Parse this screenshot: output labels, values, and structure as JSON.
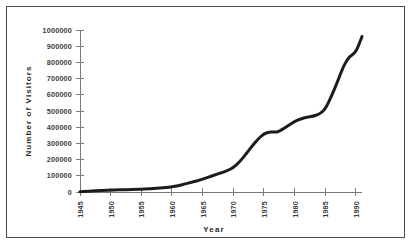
{
  "chart_data": {
    "type": "line",
    "title": "",
    "xlabel": "Year",
    "ylabel": "Number of Visitors",
    "xlim": [
      1945,
      1991
    ],
    "ylim": [
      0,
      1000000
    ],
    "grid": false,
    "legend": false,
    "legend_position": "none",
    "line_color": "#1c1c1c",
    "axis_color": "#7a7a7a",
    "background_color": "#ffffff",
    "border_color": "#4a4a4a",
    "x_tick_labels": [
      "1945",
      "1950",
      "1955",
      "1960",
      "1965",
      "1970",
      "1975",
      "1980",
      "1985",
      "1990"
    ],
    "x_tick_values": [
      1945,
      1950,
      1955,
      1960,
      1965,
      1970,
      1975,
      1980,
      1985,
      1990
    ],
    "x_tick_rotation": 90,
    "y_tick_labels": [
      "0",
      "100000",
      "200000",
      "300000",
      "400000",
      "500000",
      "600000",
      "700000",
      "800000",
      "900000",
      "1000000"
    ],
    "y_tick_values": [
      0,
      100000,
      200000,
      300000,
      400000,
      500000,
      600000,
      700000,
      800000,
      900000,
      1000000
    ],
    "series": [
      {
        "name": "Number of Visitors",
        "x": [
          1945,
          1946,
          1947,
          1948,
          1949,
          1950,
          1951,
          1952,
          1953,
          1954,
          1955,
          1956,
          1957,
          1958,
          1959,
          1960,
          1961,
          1962,
          1963,
          1964,
          1965,
          1966,
          1967,
          1968,
          1969,
          1970,
          1971,
          1972,
          1973,
          1974,
          1975,
          1976,
          1977,
          1978,
          1979,
          1980,
          1981,
          1982,
          1983,
          1984,
          1985,
          1986,
          1987,
          1988,
          1989,
          1990,
          1991
        ],
        "values": [
          2000,
          4000,
          6000,
          8000,
          10000,
          12000,
          13000,
          14000,
          15000,
          16000,
          17000,
          19000,
          21000,
          24000,
          27000,
          31000,
          39000,
          48000,
          58000,
          68000,
          79000,
          92000,
          105000,
          118000,
          131000,
          150000,
          185000,
          230000,
          280000,
          325000,
          360000,
          372000,
          368000,
          385000,
          410000,
          435000,
          452000,
          462000,
          468000,
          480000,
          510000,
          590000,
          680000,
          780000,
          840000,
          860000,
          960000
        ]
      }
    ]
  },
  "axis_titles": {
    "x": "Year",
    "y": "Number of Visitors"
  }
}
